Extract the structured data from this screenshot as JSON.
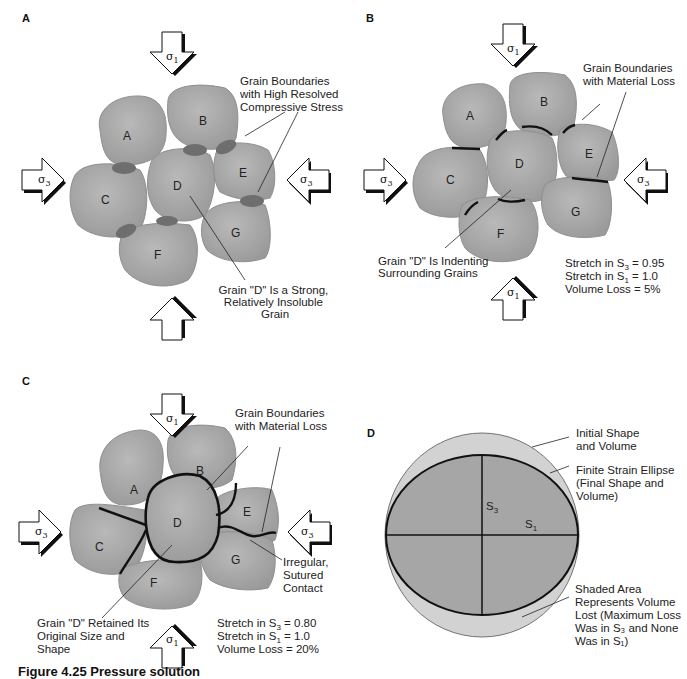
{
  "figure": {
    "caption": "Figure 4.25   Pressure solution"
  },
  "colors": {
    "grain_fill": "#a9a9a9",
    "grain_stroke": "#8f8f8f",
    "contact_fill": "#6e6e6e",
    "boundary_line": "#111111",
    "circle_fill": "#d2d2d2",
    "ellipse_fill": "#a6a6a6"
  },
  "panels": {
    "A": {
      "label": "A",
      "grains": [
        "A",
        "B",
        "C",
        "D",
        "E",
        "F",
        "G"
      ],
      "stress_top": "σ",
      "stress_top_sub": "1",
      "stress_left": "σ",
      "stress_left_sub": "3",
      "stress_right": "σ",
      "stress_right_sub": "3",
      "stress_bottom": "σ",
      "stress_bottom_sub": "1",
      "note1": [
        "Grain Boundaries",
        "with High Resolved",
        "Compressive Stress"
      ],
      "note2": [
        "Grain \"D\" Is a Strong,",
        "Relatively Insoluble",
        "Grain"
      ]
    },
    "B": {
      "label": "B",
      "grains": [
        "A",
        "B",
        "C",
        "D",
        "E",
        "F",
        "G"
      ],
      "note1": [
        "Grain Boundaries",
        "with Material Loss"
      ],
      "note2": [
        "Grain \"D\" Is Indenting",
        "Surrounding Grains"
      ],
      "stats": [
        {
          "pre": "Stretch in S",
          "sub": "3",
          "post": " = 0.95"
        },
        {
          "pre": "Stretch in S",
          "sub": "1",
          "post": " = 1.0"
        },
        {
          "pre": "Volume Loss = 5%",
          "sub": "",
          "post": ""
        }
      ]
    },
    "C": {
      "label": "C",
      "grains": [
        "A",
        "B",
        "C",
        "D",
        "E",
        "F",
        "G"
      ],
      "note1": [
        "Grain Boundaries",
        "with Material Loss"
      ],
      "note2": [
        "Irregular,",
        "Sutured",
        "Contact"
      ],
      "note3": [
        "Grain \"D\" Retained Its",
        "Original Size and",
        "Shape"
      ],
      "stats": [
        {
          "pre": "Stretch in S",
          "sub": "3",
          "post": " = 0.80"
        },
        {
          "pre": "Stretch in S",
          "sub": "1",
          "post": " = 1.0"
        },
        {
          "pre": "Volume Loss = 20%",
          "sub": "",
          "post": ""
        }
      ]
    },
    "D": {
      "label": "D",
      "axis_s3": "S",
      "axis_s3_sub": "3",
      "axis_s1": "S",
      "axis_s1_sub": "1",
      "note1": [
        "Initial Shape",
        "and Volume"
      ],
      "note2": [
        "Finite Strain Ellipse",
        "(Final Shape and",
        "Volume)"
      ],
      "note3": [
        "Shaded Area",
        "Represents Volume",
        "Lost (Maximum Loss",
        "Was in S₃ and None",
        "Was in S₁)"
      ]
    }
  }
}
